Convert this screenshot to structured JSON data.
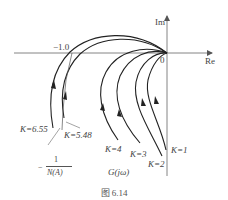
{
  "figure": {
    "caption": "图 6.14",
    "axes": {
      "x_label": "Re",
      "y_label": "Im",
      "origin_label": "0",
      "critical_point_label": "−1.0"
    },
    "describing_function_locus": {
      "label_minus": "−",
      "label_numerator": "1",
      "label_denominator": "N(A)"
    },
    "nyquist_label": "G(jω)",
    "curves": [
      {
        "k": "K=1",
        "label": "K=1"
      },
      {
        "k": "K=2",
        "label": "K=2"
      },
      {
        "k": "K=3",
        "label": "K=3"
      },
      {
        "k": "K=4",
        "label": "K=4"
      },
      {
        "k": "K=5.48",
        "label": "K=5.48"
      },
      {
        "k": "K=6.55",
        "label": "K=6.55"
      }
    ],
    "colors": {
      "line": "#222222",
      "axis": "#555555",
      "text": "#444444"
    }
  }
}
